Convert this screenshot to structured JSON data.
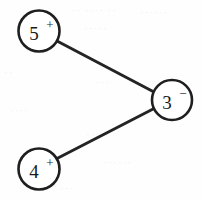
{
  "figure": {
    "background_color": "#fefefe",
    "stroke_color": "#242424",
    "node_fill_color": "#ffffff",
    "width": 202,
    "height": 199
  },
  "nodes": [
    {
      "id": "node-5-plus",
      "value": "5",
      "sign": "+",
      "cx": 39,
      "cy": 31,
      "r": 20.5
    },
    {
      "id": "node-3-minus",
      "value": "3",
      "sign": "−",
      "cx": 172,
      "cy": 100,
      "r": 20.0
    },
    {
      "id": "node-4-plus",
      "value": "4",
      "sign": "+",
      "cx": 39,
      "cy": 169,
      "r": 20.5
    }
  ],
  "edges": [
    {
      "id": "edge-5-to-3",
      "from": "node-5-plus",
      "to": "node-3-minus",
      "x1": 57,
      "y1": 41,
      "x2": 154,
      "y2": 92
    },
    {
      "id": "edge-4-to-3",
      "from": "node-4-plus",
      "to": "node-3-minus",
      "x1": 58,
      "y1": 158,
      "x2": 155,
      "y2": 108
    }
  ],
  "background_artifacts": [
    {
      "text": "·· ···· ··",
      "x": 72,
      "y": 4
    },
    {
      "text": "······",
      "x": 140,
      "y": 6
    },
    {
      "text": "·····",
      "x": 84,
      "y": 22
    },
    {
      "text": "··",
      "x": 4,
      "y": 66
    },
    {
      "text": "···",
      "x": 96,
      "y": 76
    },
    {
      "text": "····",
      "x": 10,
      "y": 104
    },
    {
      "text": "·····",
      "x": 86,
      "y": 128
    },
    {
      "text": "······",
      "x": 104,
      "y": 156
    },
    {
      "text": "···",
      "x": 60,
      "y": 182
    }
  ]
}
